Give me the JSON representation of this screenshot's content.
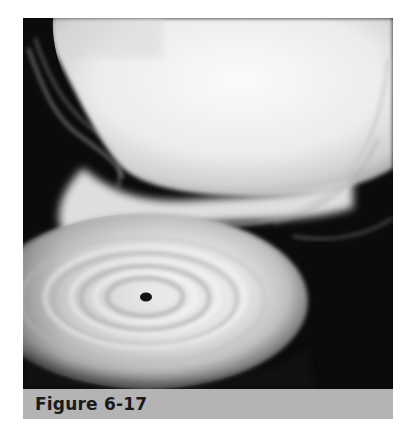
{
  "figure": {
    "caption": "Figure 6-17",
    "illustration": "star-accretion-disk-black-hole",
    "colors": {
      "background": "#0b0b0b",
      "caption_bar": "#b4b4b4",
      "caption_text": "#1a1a1a",
      "gas": "#f2f2f2"
    }
  }
}
